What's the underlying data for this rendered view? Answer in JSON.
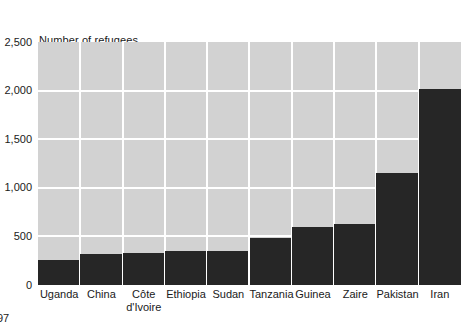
{
  "page": {
    "page_number": "97"
  },
  "chart_data": {
    "type": "bar",
    "title": "Number of refugees in thousands",
    "title_lines": [
      "Number of refugees",
      "in thousands"
    ],
    "xlabel": "",
    "ylabel": "Number of refugees in thousands",
    "ylim": [
      0,
      2500
    ],
    "grid": true,
    "legend": "none",
    "orientation": "vertical",
    "bar_color": "#262626",
    "plot_background": "#d2d2d2",
    "gridline_color": "#ffffff",
    "ytick_labels": [
      "2,500",
      "2,000",
      "1,500",
      "1,000",
      "500",
      "0"
    ],
    "ytick_values": [
      2500,
      2000,
      1500,
      1000,
      500,
      0
    ],
    "categories": [
      "Uganda",
      "China",
      "Côte d'Ivoire",
      "Ethiopia",
      "Sudan",
      "Tanzania",
      "Guinea",
      "Zaire",
      "Pakistan",
      "Iran"
    ],
    "category_label_lines": [
      [
        "Uganda"
      ],
      [
        "China"
      ],
      [
        "Côte",
        "d'Ivoire"
      ],
      [
        "Ethiopia"
      ],
      [
        "Sudan"
      ],
      [
        "Tanzania"
      ],
      [
        "Guinea"
      ],
      [
        "Zaire"
      ],
      [
        "Pakistan"
      ],
      [
        "Iran"
      ]
    ],
    "values": [
      255,
      320,
      330,
      350,
      350,
      480,
      600,
      630,
      1150,
      2020
    ]
  }
}
